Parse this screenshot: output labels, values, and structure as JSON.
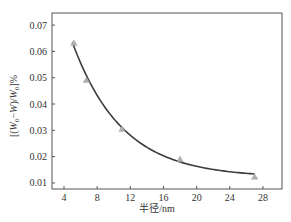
{
  "chart_data": {
    "type": "scatter",
    "title": "",
    "xlabel": "半径/nm",
    "ylabel": "[(W0−W)/W0]%",
    "ylabel_parts": {
      "open": "[(",
      "w1": "W",
      "sub1": "0",
      "minus": "−",
      "w2": "W",
      "mid": ")/",
      "w3": "W",
      "sub2": "0",
      "close": "]%"
    },
    "xlim": [
      2.55,
      30.3
    ],
    "ylim": [
      0.0077,
      0.0746
    ],
    "xticks": [
      4,
      8,
      12,
      16,
      20,
      24,
      28
    ],
    "yticks": [
      0.01,
      0.02,
      0.03,
      0.04,
      0.05,
      0.06,
      0.07
    ],
    "ytick_labels": [
      "0.01",
      "0.02",
      "0.03",
      "0.04",
      "0.05",
      "0.06",
      "0.07"
    ],
    "grid": false,
    "legend": null,
    "series": [
      {
        "name": "measured",
        "kind": "scatter",
        "marker": "triangle",
        "color": "#b0b0b0",
        "x": [
          5.2,
          6.7,
          11.0,
          18.0,
          27.0
        ],
        "y": [
          0.0632,
          0.0491,
          0.0305,
          0.019,
          0.0123
        ]
      },
      {
        "name": "fit",
        "kind": "line",
        "color": "#3c3c3c",
        "model": "y = y0 + A*exp(-x/t)",
        "params": {
          "y0": 0.0121,
          "A": 0.1183,
          "t": 6.0
        },
        "x_range": [
          5.0,
          27.0
        ]
      }
    ]
  },
  "plot_box": {
    "left": 52,
    "top": 13,
    "right": 282,
    "bottom": 189
  },
  "colors": {
    "axis": "#555555",
    "text": "#333333",
    "marker": "#b0b0b0",
    "curve": "#3c3c3c"
  }
}
